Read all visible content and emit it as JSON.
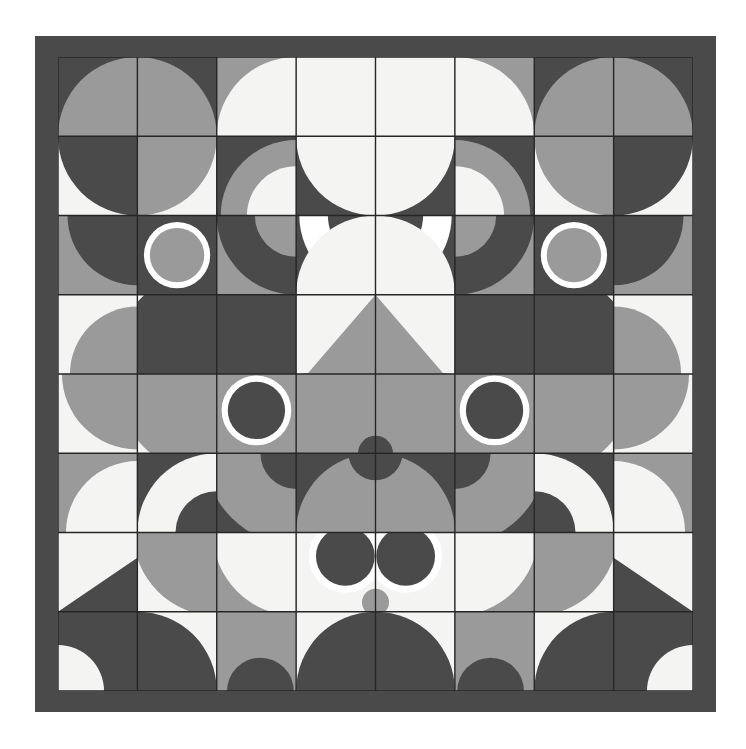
{
  "artwork": {
    "title": "Geometric Grid Composition",
    "type": "abstract-generative-tile-grid",
    "canvas": {
      "width": 746,
      "height": 749,
      "background": "#ffffff"
    },
    "frame": {
      "x": 35,
      "y": 36,
      "width": 681,
      "height": 676,
      "color": "#4a4a4a",
      "inner_x": 58,
      "inner_y": 57,
      "inner_width": 635,
      "inner_height": 634
    },
    "grid": {
      "columns": 8,
      "rows": 8,
      "cell_width": 79.375,
      "cell_height": 79.25,
      "line_color": "#262626",
      "line_width": 1.4
    },
    "palette": {
      "charcoal": "#4a4a4a",
      "mid_gray": "#9a9a9a",
      "light_gray": "#b9b9b9",
      "off_white": "#f4f4f2",
      "ring_white": "#ffffff",
      "grid_line": "#262626",
      "page_background": "#ffffff"
    },
    "motifs": [
      "quarter-circle",
      "half-circle",
      "full-circle",
      "ring",
      "triangle",
      "diagonal-split",
      "solid-fill",
      "lens"
    ],
    "symmetry": "bilateral-vertical-mirror",
    "composition_note": "Stacked face-like forms: upper eyes with ring pupils, central triangular snout, lower eyes with ring pupils"
  },
  "tiles": [
    {
      "r": 0,
      "c": 0,
      "bg": "#4a4a4a",
      "shapes": [
        {
          "k": "qc",
          "corner": "br",
          "rr": 1.0,
          "f": "#9a9a9a"
        }
      ]
    },
    {
      "r": 0,
      "c": 1,
      "bg": "#4a4a4a",
      "shapes": [
        {
          "k": "qc",
          "corner": "bl",
          "rr": 1.0,
          "f": "#9a9a9a"
        }
      ]
    },
    {
      "r": 0,
      "c": 2,
      "bg": "#9a9a9a",
      "shapes": [
        {
          "k": "qc",
          "corner": "br",
          "rr": 1.0,
          "f": "#f4f4f2"
        }
      ]
    },
    {
      "r": 0,
      "c": 3,
      "bg": "#f4f4f2",
      "shapes": []
    },
    {
      "r": 0,
      "c": 4,
      "bg": "#f4f4f2",
      "shapes": []
    },
    {
      "r": 0,
      "c": 5,
      "bg": "#9a9a9a",
      "shapes": [
        {
          "k": "qc",
          "corner": "bl",
          "rr": 1.0,
          "f": "#f4f4f2"
        }
      ]
    },
    {
      "r": 0,
      "c": 6,
      "bg": "#4a4a4a",
      "shapes": [
        {
          "k": "qc",
          "corner": "br",
          "rr": 1.0,
          "f": "#9a9a9a"
        }
      ]
    },
    {
      "r": 0,
      "c": 7,
      "bg": "#4a4a4a",
      "shapes": [
        {
          "k": "qc",
          "corner": "bl",
          "rr": 1.0,
          "f": "#9a9a9a"
        }
      ]
    },
    {
      "r": 1,
      "c": 0,
      "bg": "#f4f4f2",
      "shapes": [
        {
          "k": "qc",
          "corner": "tr",
          "rr": 1.0,
          "f": "#4a4a4a"
        }
      ]
    },
    {
      "r": 1,
      "c": 1,
      "bg": "#f4f4f2",
      "shapes": [
        {
          "k": "qc",
          "corner": "tl",
          "rr": 1.0,
          "f": "#9a9a9a"
        }
      ]
    },
    {
      "r": 1,
      "c": 2,
      "bg": "#4a4a4a",
      "shapes": [
        {
          "k": "qc",
          "corner": "br",
          "rr": 0.95,
          "f": "#9a9a9a"
        },
        {
          "k": "qc",
          "corner": "br",
          "rr": 0.62,
          "f": "#f4f4f2"
        }
      ]
    },
    {
      "r": 1,
      "c": 3,
      "bg": "#4a4a4a",
      "shapes": [
        {
          "k": "qc",
          "corner": "tr",
          "rr": 1.0,
          "f": "#f4f4f2"
        }
      ]
    },
    {
      "r": 1,
      "c": 4,
      "bg": "#4a4a4a",
      "shapes": [
        {
          "k": "qc",
          "corner": "tl",
          "rr": 1.0,
          "f": "#f4f4f2"
        }
      ]
    },
    {
      "r": 1,
      "c": 5,
      "bg": "#4a4a4a",
      "shapes": [
        {
          "k": "qc",
          "corner": "bl",
          "rr": 0.95,
          "f": "#9a9a9a"
        },
        {
          "k": "qc",
          "corner": "bl",
          "rr": 0.62,
          "f": "#f4f4f2"
        }
      ]
    },
    {
      "r": 1,
      "c": 6,
      "bg": "#f4f4f2",
      "shapes": [
        {
          "k": "qc",
          "corner": "tr",
          "rr": 1.0,
          "f": "#9a9a9a"
        }
      ]
    },
    {
      "r": 1,
      "c": 7,
      "bg": "#f4f4f2",
      "shapes": [
        {
          "k": "qc",
          "corner": "tl",
          "rr": 1.0,
          "f": "#4a4a4a"
        }
      ]
    },
    {
      "r": 2,
      "c": 0,
      "bg": "#9a9a9a",
      "shapes": [
        {
          "k": "qc",
          "corner": "tr",
          "rr": 0.88,
          "f": "#4a4a4a"
        }
      ]
    },
    {
      "r": 2,
      "c": 1,
      "bg": "#4a4a4a",
      "shapes": [
        {
          "k": "ring",
          "cx": 0.5,
          "cy": 0.5,
          "rr": 0.38,
          "f": "#9a9a9a",
          "stroke": "#ffffff",
          "sw": 0.075
        }
      ]
    },
    {
      "r": 2,
      "c": 2,
      "bg": "#9a9a9a",
      "shapes": [
        {
          "k": "qc",
          "corner": "tr",
          "rr": 1.0,
          "f": "#4a4a4a"
        },
        {
          "k": "qc",
          "corner": "tr",
          "rr": 0.52,
          "f": "#9a9a9a"
        }
      ]
    },
    {
      "r": 2,
      "c": 3,
      "bg": "#4a4a4a",
      "shapes": [
        {
          "k": "qc",
          "corner": "tr",
          "rr": 0.96,
          "f": "#ffffff"
        },
        {
          "k": "qc",
          "corner": "tr",
          "rr": 0.6,
          "f": "#4a4a4a"
        },
        {
          "k": "qc",
          "corner": "br",
          "rr": 1.0,
          "f": "#f4f4f2"
        }
      ]
    },
    {
      "r": 2,
      "c": 4,
      "bg": "#4a4a4a",
      "shapes": [
        {
          "k": "qc",
          "corner": "tl",
          "rr": 0.96,
          "f": "#ffffff"
        },
        {
          "k": "qc",
          "corner": "tl",
          "rr": 0.6,
          "f": "#4a4a4a"
        },
        {
          "k": "qc",
          "corner": "bl",
          "rr": 1.0,
          "f": "#f4f4f2"
        }
      ]
    },
    {
      "r": 2,
      "c": 5,
      "bg": "#9a9a9a",
      "shapes": [
        {
          "k": "qc",
          "corner": "tl",
          "rr": 1.0,
          "f": "#4a4a4a"
        },
        {
          "k": "qc",
          "corner": "tl",
          "rr": 0.52,
          "f": "#9a9a9a"
        }
      ]
    },
    {
      "r": 2,
      "c": 6,
      "bg": "#4a4a4a",
      "shapes": [
        {
          "k": "ring",
          "cx": 0.5,
          "cy": 0.5,
          "rr": 0.38,
          "f": "#9a9a9a",
          "stroke": "#ffffff",
          "sw": 0.075
        }
      ]
    },
    {
      "r": 2,
      "c": 7,
      "bg": "#9a9a9a",
      "shapes": [
        {
          "k": "qc",
          "corner": "tl",
          "rr": 0.88,
          "f": "#4a4a4a"
        }
      ]
    },
    {
      "r": 3,
      "c": 0,
      "bg": "#f4f4f2",
      "shapes": [
        {
          "k": "qc",
          "corner": "br",
          "rr": 0.85,
          "f": "#9a9a9a"
        }
      ]
    },
    {
      "r": 3,
      "c": 1,
      "bg": "#f4f4f2",
      "shapes": [
        {
          "k": "qc",
          "corner": "br",
          "rr": 1.35,
          "f": "#4a4a4a"
        }
      ]
    },
    {
      "r": 3,
      "c": 2,
      "bg": "#9a9a9a",
      "shapes": [
        {
          "k": "qc",
          "corner": "bl",
          "rr": 1.4,
          "f": "#4a4a4a"
        }
      ]
    },
    {
      "r": 3,
      "c": 3,
      "bg": "#4a4a4a",
      "shapes": [
        {
          "k": "qc",
          "corner": "tl",
          "rr": 1.0,
          "f": "#f4f4f2"
        },
        {
          "k": "tri",
          "pts": "1,0 0.14,1 1,1",
          "f": "#9a9a9a"
        }
      ]
    },
    {
      "r": 3,
      "c": 4,
      "bg": "#4a4a4a",
      "shapes": [
        {
          "k": "qc",
          "corner": "tr",
          "rr": 1.0,
          "f": "#f4f4f2"
        },
        {
          "k": "tri",
          "pts": "0,0 0.86,1 0,1",
          "f": "#9a9a9a"
        }
      ]
    },
    {
      "r": 3,
      "c": 5,
      "bg": "#9a9a9a",
      "shapes": [
        {
          "k": "qc",
          "corner": "br",
          "rr": 1.4,
          "f": "#4a4a4a"
        }
      ]
    },
    {
      "r": 3,
      "c": 6,
      "bg": "#f4f4f2",
      "shapes": [
        {
          "k": "qc",
          "corner": "bl",
          "rr": 1.35,
          "f": "#4a4a4a"
        }
      ]
    },
    {
      "r": 3,
      "c": 7,
      "bg": "#f4f4f2",
      "shapes": [
        {
          "k": "qc",
          "corner": "bl",
          "rr": 0.85,
          "f": "#9a9a9a"
        }
      ]
    },
    {
      "r": 4,
      "c": 0,
      "bg": "#f4f4f2",
      "shapes": [
        {
          "k": "qc",
          "corner": "tr",
          "rr": 0.95,
          "f": "#9a9a9a"
        }
      ]
    },
    {
      "r": 4,
      "c": 1,
      "bg": "#f4f4f2",
      "shapes": [
        {
          "k": "qc",
          "corner": "tr",
          "rr": 1.3,
          "f": "#9a9a9a"
        }
      ]
    },
    {
      "r": 4,
      "c": 2,
      "bg": "#9a9a9a",
      "shapes": [
        {
          "k": "ring",
          "cx": 0.5,
          "cy": 0.46,
          "rr": 0.4,
          "f": "#4a4a4a",
          "stroke": "#ffffff",
          "sw": 0.078
        }
      ]
    },
    {
      "r": 4,
      "c": 3,
      "bg": "#9a9a9a",
      "shapes": [
        {
          "k": "tri",
          "pts": "1,0 0.30,1 1,1",
          "f": "#9a9a9a"
        },
        {
          "k": "circ",
          "cx": 1.0,
          "cy": 1.0,
          "rr": 0.22,
          "f": "#4a4a4a"
        }
      ]
    },
    {
      "r": 4,
      "c": 4,
      "bg": "#9a9a9a",
      "shapes": [
        {
          "k": "tri",
          "pts": "0,0 0.70,1 0,1",
          "f": "#9a9a9a"
        },
        {
          "k": "circ",
          "cx": 0.0,
          "cy": 1.0,
          "rr": 0.22,
          "f": "#4a4a4a"
        }
      ]
    },
    {
      "r": 4,
      "c": 5,
      "bg": "#9a9a9a",
      "shapes": [
        {
          "k": "ring",
          "cx": 0.5,
          "cy": 0.46,
          "rr": 0.4,
          "f": "#4a4a4a",
          "stroke": "#ffffff",
          "sw": 0.078
        }
      ]
    },
    {
      "r": 4,
      "c": 6,
      "bg": "#f4f4f2",
      "shapes": [
        {
          "k": "qc",
          "corner": "tl",
          "rr": 1.3,
          "f": "#9a9a9a"
        }
      ]
    },
    {
      "r": 4,
      "c": 7,
      "bg": "#f4f4f2",
      "shapes": [
        {
          "k": "qc",
          "corner": "tl",
          "rr": 0.95,
          "f": "#9a9a9a"
        }
      ]
    },
    {
      "r": 5,
      "c": 0,
      "bg": "#9a9a9a",
      "shapes": [
        {
          "k": "qc",
          "corner": "br",
          "rr": 0.9,
          "f": "#f4f4f2"
        }
      ]
    },
    {
      "r": 5,
      "c": 1,
      "bg": "#4a4a4a",
      "shapes": [
        {
          "k": "qc",
          "corner": "br",
          "rr": 1.0,
          "f": "#f4f4f2"
        },
        {
          "k": "qc",
          "corner": "br",
          "rr": 0.52,
          "f": "#4a4a4a"
        }
      ]
    },
    {
      "r": 5,
      "c": 2,
      "bg": "#4a4a4a",
      "shapes": [
        {
          "k": "qc",
          "corner": "tr",
          "rr": 1.15,
          "f": "#9a9a9a"
        },
        {
          "k": "circ",
          "cx": 1.0,
          "cy": 0.0,
          "rr": 0.45,
          "f": "#4a4a4a"
        }
      ]
    },
    {
      "r": 5,
      "c": 3,
      "bg": "#4a4a4a",
      "shapes": [
        {
          "k": "qc",
          "corner": "br",
          "rr": 1.0,
          "f": "#9a9a9a"
        },
        {
          "k": "circ",
          "cx": 1.0,
          "cy": 0.0,
          "rr": 0.34,
          "f": "#4a4a4a"
        }
      ]
    },
    {
      "r": 5,
      "c": 4,
      "bg": "#4a4a4a",
      "shapes": [
        {
          "k": "qc",
          "corner": "bl",
          "rr": 1.0,
          "f": "#9a9a9a"
        },
        {
          "k": "circ",
          "cx": 0.0,
          "cy": 0.0,
          "rr": 0.34,
          "f": "#4a4a4a"
        }
      ]
    },
    {
      "r": 5,
      "c": 5,
      "bg": "#4a4a4a",
      "shapes": [
        {
          "k": "qc",
          "corner": "tl",
          "rr": 1.15,
          "f": "#9a9a9a"
        },
        {
          "k": "circ",
          "cx": 0.0,
          "cy": 0.0,
          "rr": 0.45,
          "f": "#4a4a4a"
        }
      ]
    },
    {
      "r": 5,
      "c": 6,
      "bg": "#4a4a4a",
      "shapes": [
        {
          "k": "qc",
          "corner": "bl",
          "rr": 1.0,
          "f": "#f4f4f2"
        },
        {
          "k": "qc",
          "corner": "bl",
          "rr": 0.52,
          "f": "#4a4a4a"
        }
      ]
    },
    {
      "r": 5,
      "c": 7,
      "bg": "#9a9a9a",
      "shapes": [
        {
          "k": "qc",
          "corner": "bl",
          "rr": 0.9,
          "f": "#f4f4f2"
        }
      ]
    },
    {
      "r": 6,
      "c": 0,
      "bg": "#f4f4f2",
      "shapes": [
        {
          "k": "tri",
          "pts": "1,0.32 1,1 0,1",
          "f": "#4a4a4a"
        }
      ]
    },
    {
      "r": 6,
      "c": 1,
      "bg": "#f4f4f2",
      "shapes": [
        {
          "k": "qc",
          "corner": "tr",
          "rr": 1.05,
          "f": "#9a9a9a"
        }
      ]
    },
    {
      "r": 6,
      "c": 2,
      "bg": "#9a9a9a",
      "shapes": [
        {
          "k": "qc",
          "corner": "tr",
          "rr": 1.05,
          "f": "#f4f4f2"
        }
      ]
    },
    {
      "r": 6,
      "c": 3,
      "bg": "#f4f4f2",
      "shapes": [
        {
          "k": "circ",
          "cx": 0.62,
          "cy": 0.3,
          "rr": 0.46,
          "f": "#ffffff"
        },
        {
          "k": "circ",
          "cx": 0.62,
          "cy": 0.3,
          "rr": 0.37,
          "f": "#4a4a4a"
        },
        {
          "k": "circ",
          "cx": 1.0,
          "cy": 0.88,
          "rr": 0.17,
          "f": "#9a9a9a"
        }
      ]
    },
    {
      "r": 6,
      "c": 4,
      "bg": "#f4f4f2",
      "shapes": [
        {
          "k": "circ",
          "cx": 0.38,
          "cy": 0.3,
          "rr": 0.46,
          "f": "#ffffff"
        },
        {
          "k": "circ",
          "cx": 0.38,
          "cy": 0.3,
          "rr": 0.37,
          "f": "#4a4a4a"
        },
        {
          "k": "circ",
          "cx": 0.0,
          "cy": 0.88,
          "rr": 0.17,
          "f": "#9a9a9a"
        }
      ]
    },
    {
      "r": 6,
      "c": 5,
      "bg": "#9a9a9a",
      "shapes": [
        {
          "k": "qc",
          "corner": "tl",
          "rr": 1.05,
          "f": "#f4f4f2"
        }
      ]
    },
    {
      "r": 6,
      "c": 6,
      "bg": "#f4f4f2",
      "shapes": [
        {
          "k": "qc",
          "corner": "tl",
          "rr": 1.05,
          "f": "#9a9a9a"
        }
      ]
    },
    {
      "r": 6,
      "c": 7,
      "bg": "#f4f4f2",
      "shapes": [
        {
          "k": "tri",
          "pts": "0,0.32 1,1 0,1",
          "f": "#4a4a4a"
        }
      ]
    },
    {
      "r": 7,
      "c": 0,
      "bg": "#4a4a4a",
      "shapes": [
        {
          "k": "qc",
          "corner": "bl",
          "rr": 0.58,
          "f": "#f4f4f2"
        }
      ]
    },
    {
      "r": 7,
      "c": 1,
      "bg": "#f4f4f2",
      "shapes": [
        {
          "k": "qc",
          "corner": "bl",
          "rr": 1.0,
          "f": "#4a4a4a"
        }
      ]
    },
    {
      "r": 7,
      "c": 2,
      "bg": "#9a9a9a",
      "shapes": [
        {
          "k": "circ",
          "cx": 0.55,
          "cy": 1.0,
          "rr": 0.42,
          "f": "#4a4a4a"
        }
      ]
    },
    {
      "r": 7,
      "c": 3,
      "bg": "#f4f4f2",
      "shapes": [
        {
          "k": "qc",
          "corner": "br",
          "rr": 1.0,
          "f": "#4a4a4a"
        }
      ]
    },
    {
      "r": 7,
      "c": 4,
      "bg": "#f4f4f2",
      "shapes": [
        {
          "k": "qc",
          "corner": "bl",
          "rr": 1.0,
          "f": "#4a4a4a"
        }
      ]
    },
    {
      "r": 7,
      "c": 5,
      "bg": "#9a9a9a",
      "shapes": [
        {
          "k": "circ",
          "cx": 0.45,
          "cy": 1.0,
          "rr": 0.42,
          "f": "#4a4a4a"
        }
      ]
    },
    {
      "r": 7,
      "c": 6,
      "bg": "#f4f4f2",
      "shapes": [
        {
          "k": "qc",
          "corner": "br",
          "rr": 1.0,
          "f": "#4a4a4a"
        }
      ]
    },
    {
      "r": 7,
      "c": 7,
      "bg": "#4a4a4a",
      "shapes": [
        {
          "k": "qc",
          "corner": "br",
          "rr": 0.58,
          "f": "#f4f4f2"
        }
      ]
    }
  ]
}
